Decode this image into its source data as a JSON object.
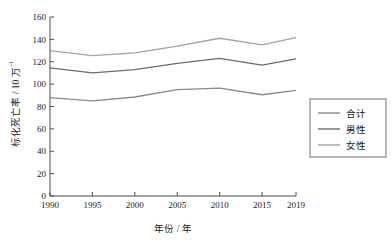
{
  "chart_data": {
    "type": "line",
    "title": "",
    "xlabel": "年份 / 年",
    "ylabel": "标化死亡率 / 10 万 ⁻¹",
    "ylabel_main": "标化死亡率 / 10 万",
    "ylabel_exponent": "-1",
    "categories": [
      "1990",
      "1995",
      "2000",
      "2005",
      "2010",
      "2015",
      "2019"
    ],
    "x": [
      1990,
      1995,
      2000,
      2005,
      2010,
      2015,
      2019
    ],
    "xlim": [
      1990,
      2019
    ],
    "ylim": [
      0,
      160
    ],
    "yticks": [
      0,
      20,
      40,
      60,
      80,
      100,
      120,
      140,
      160
    ],
    "ytick_labels": [
      "0",
      "20",
      "40",
      "60",
      "80",
      "100",
      "120",
      "140",
      "160"
    ],
    "grid": false,
    "legend_position": "right",
    "series": [
      {
        "name": "合计",
        "values": [
          88,
          85,
          88.5,
          95,
          96.5,
          90.5,
          94.5
        ],
        "color": "#8a8a8a"
      },
      {
        "name": "男性",
        "values": [
          114.5,
          110,
          113,
          118.5,
          123,
          117,
          122.5
        ],
        "color": "#6b6b6b"
      },
      {
        "name": "女性",
        "values": [
          130,
          125.5,
          128,
          134,
          141,
          135,
          141.5
        ],
        "color": "#a3a3a3"
      }
    ]
  },
  "axes": {
    "axis_color": "#4d4d4d",
    "background": "#ffffff"
  },
  "legend": {
    "border_color": "#6e6e6e",
    "items": [
      {
        "label": "合计",
        "color": "#8a8a8a"
      },
      {
        "label": "男性",
        "color": "#6b6b6b"
      },
      {
        "label": "女性",
        "color": "#a3a3a3"
      }
    ]
  }
}
